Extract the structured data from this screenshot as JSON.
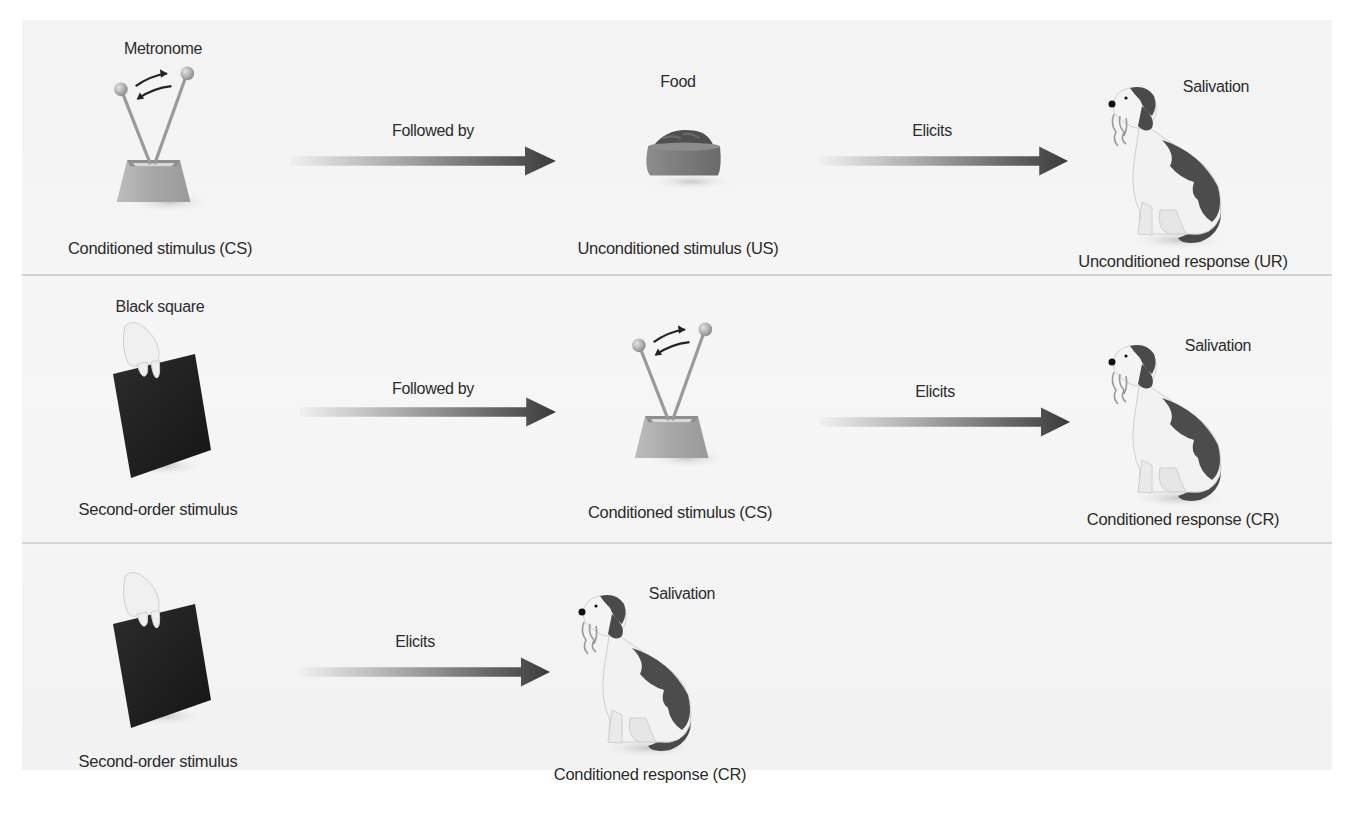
{
  "figure": {
    "colors": {
      "background": "#f4f4f4",
      "divider": "#d4d4d4",
      "arrow_start": "#e6e6e6",
      "arrow_end": "#3c3c3c",
      "text": "#2b2b2b"
    },
    "rows": [
      {
        "stimulus_top": "Metronome",
        "stimulus_bottom": "Conditioned stimulus (CS)",
        "arrow1": "Followed by",
        "middle_top": "Food",
        "middle_bottom": "Unconditioned stimulus (US)",
        "arrow2": "Elicits",
        "response_top": "Salivation",
        "response_bottom": "Unconditioned response (UR)"
      },
      {
        "stimulus_top": "Black square",
        "stimulus_bottom": "Second-order stimulus",
        "arrow1": "Followed by",
        "middle_bottom": "Conditioned stimulus (CS)",
        "arrow2": "Elicits",
        "response_top": "Salivation",
        "response_bottom": "Conditioned response (CR)"
      },
      {
        "stimulus_bottom": "Second-order stimulus",
        "arrow1": "Elicits",
        "response_top": "Salivation",
        "response_bottom": "Conditioned response (CR)"
      }
    ],
    "icons": {
      "metronome": "metronome-icon",
      "food_bowl": "food-bowl-icon",
      "dog": "salivating-dog-icon",
      "black_square": "hand-holding-black-square-icon",
      "arrow": "gradient-right-arrow-icon"
    }
  }
}
